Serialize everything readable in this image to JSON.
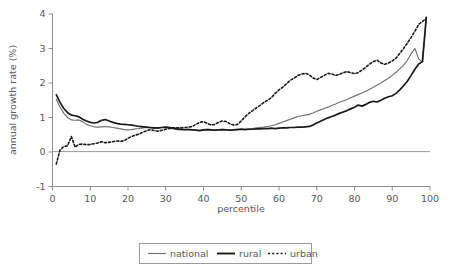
{
  "chart_data": {
    "type": "line",
    "title": "",
    "xlabel": "percentile",
    "ylabel": "annual growth rate (%)",
    "xlim": [
      0,
      100
    ],
    "ylim": [
      -1,
      4
    ],
    "xticks": [
      0,
      10,
      20,
      30,
      40,
      50,
      60,
      70,
      80,
      90,
      100
    ],
    "yticks": [
      -1,
      0,
      1,
      2,
      3,
      4
    ],
    "grid": false,
    "zero_reference_line": true,
    "legend_position": "bottom-center",
    "colors": {
      "national": "#6f6f71",
      "rural": "#1a1a1a",
      "urban": "#1a1a1a",
      "axis": "#8d8d8f",
      "text": "#58585a",
      "background": "#ffffff"
    },
    "x": [
      1,
      2,
      3,
      4,
      5,
      6,
      7,
      8,
      9,
      10,
      11,
      12,
      13,
      14,
      15,
      16,
      17,
      18,
      19,
      20,
      21,
      22,
      23,
      24,
      25,
      26,
      27,
      28,
      29,
      30,
      31,
      32,
      33,
      34,
      35,
      36,
      37,
      38,
      39,
      40,
      41,
      42,
      43,
      44,
      45,
      46,
      47,
      48,
      49,
      50,
      51,
      52,
      53,
      54,
      55,
      56,
      57,
      58,
      59,
      60,
      61,
      62,
      63,
      64,
      65,
      66,
      67,
      68,
      69,
      70,
      71,
      72,
      73,
      74,
      75,
      76,
      77,
      78,
      79,
      80,
      81,
      82,
      83,
      84,
      85,
      86,
      87,
      88,
      89,
      90,
      91,
      92,
      93,
      94,
      95,
      96,
      97,
      98,
      99
    ],
    "series": [
      {
        "name": "national",
        "style": "solid-thin",
        "values": [
          1.53,
          1.3,
          1.12,
          1.0,
          0.93,
          0.92,
          0.93,
          0.88,
          0.8,
          0.76,
          0.73,
          0.72,
          0.73,
          0.74,
          0.73,
          0.71,
          0.69,
          0.67,
          0.65,
          0.64,
          0.65,
          0.67,
          0.68,
          0.7,
          0.71,
          0.7,
          0.68,
          0.69,
          0.71,
          0.72,
          0.7,
          0.67,
          0.65,
          0.64,
          0.65,
          0.66,
          0.65,
          0.64,
          0.63,
          0.65,
          0.66,
          0.65,
          0.64,
          0.65,
          0.66,
          0.65,
          0.64,
          0.65,
          0.66,
          0.67,
          0.66,
          0.67,
          0.68,
          0.7,
          0.71,
          0.72,
          0.74,
          0.76,
          0.79,
          0.83,
          0.87,
          0.91,
          0.95,
          0.99,
          1.03,
          1.05,
          1.07,
          1.09,
          1.13,
          1.18,
          1.22,
          1.26,
          1.3,
          1.35,
          1.39,
          1.44,
          1.48,
          1.52,
          1.57,
          1.62,
          1.67,
          1.71,
          1.76,
          1.82,
          1.88,
          1.94,
          2.0,
          2.07,
          2.14,
          2.22,
          2.31,
          2.41,
          2.52,
          2.66,
          2.85,
          3.0,
          2.7,
          2.6,
          3.85
        ]
      },
      {
        "name": "rural",
        "style": "solid-thick",
        "values": [
          1.66,
          1.44,
          1.26,
          1.14,
          1.07,
          1.05,
          1.02,
          0.95,
          0.9,
          0.86,
          0.84,
          0.86,
          0.92,
          0.94,
          0.9,
          0.86,
          0.83,
          0.81,
          0.8,
          0.79,
          0.78,
          0.76,
          0.74,
          0.73,
          0.72,
          0.71,
          0.7,
          0.7,
          0.71,
          0.72,
          0.71,
          0.69,
          0.67,
          0.66,
          0.65,
          0.65,
          0.64,
          0.63,
          0.62,
          0.64,
          0.65,
          0.64,
          0.63,
          0.64,
          0.65,
          0.64,
          0.63,
          0.64,
          0.65,
          0.66,
          0.65,
          0.66,
          0.66,
          0.67,
          0.67,
          0.68,
          0.68,
          0.69,
          0.68,
          0.69,
          0.7,
          0.7,
          0.71,
          0.71,
          0.72,
          0.72,
          0.73,
          0.74,
          0.78,
          0.84,
          0.89,
          0.94,
          0.99,
          1.03,
          1.07,
          1.12,
          1.16,
          1.2,
          1.25,
          1.3,
          1.36,
          1.33,
          1.38,
          1.44,
          1.47,
          1.45,
          1.5,
          1.56,
          1.6,
          1.63,
          1.7,
          1.8,
          1.92,
          2.05,
          2.22,
          2.4,
          2.55,
          2.62,
          3.9
        ]
      },
      {
        "name": "urban",
        "style": "dotted",
        "values": [
          -0.35,
          0.06,
          0.16,
          0.18,
          0.45,
          0.14,
          0.22,
          0.23,
          0.21,
          0.22,
          0.24,
          0.26,
          0.3,
          0.27,
          0.28,
          0.3,
          0.32,
          0.31,
          0.33,
          0.4,
          0.45,
          0.49,
          0.52,
          0.58,
          0.62,
          0.65,
          0.62,
          0.6,
          0.63,
          0.66,
          0.68,
          0.7,
          0.7,
          0.7,
          0.71,
          0.72,
          0.74,
          0.8,
          0.86,
          0.88,
          0.83,
          0.78,
          0.8,
          0.86,
          0.9,
          0.88,
          0.82,
          0.78,
          0.8,
          0.9,
          1.02,
          1.12,
          1.2,
          1.28,
          1.35,
          1.44,
          1.5,
          1.58,
          1.7,
          1.8,
          1.88,
          1.98,
          2.08,
          2.14,
          2.22,
          2.26,
          2.28,
          2.24,
          2.15,
          2.1,
          2.16,
          2.22,
          2.28,
          2.26,
          2.22,
          2.25,
          2.3,
          2.33,
          2.3,
          2.27,
          2.3,
          2.38,
          2.46,
          2.55,
          2.62,
          2.66,
          2.58,
          2.54,
          2.58,
          2.64,
          2.72,
          2.86,
          3.0,
          3.16,
          3.32,
          3.5,
          3.7,
          3.78,
          3.88
        ]
      }
    ]
  },
  "legend": {
    "items": [
      {
        "label": "national"
      },
      {
        "label": "rural"
      },
      {
        "label": "urban"
      }
    ]
  },
  "axes": {
    "y_title": "annual growth rate (%)",
    "x_title": "percentile",
    "y_tick_labels": [
      "4",
      "3",
      "2",
      "1",
      "0",
      "-1"
    ],
    "x_tick_labels": [
      "0",
      "10",
      "20",
      "30",
      "40",
      "50",
      "60",
      "70",
      "80",
      "90",
      "100"
    ]
  }
}
